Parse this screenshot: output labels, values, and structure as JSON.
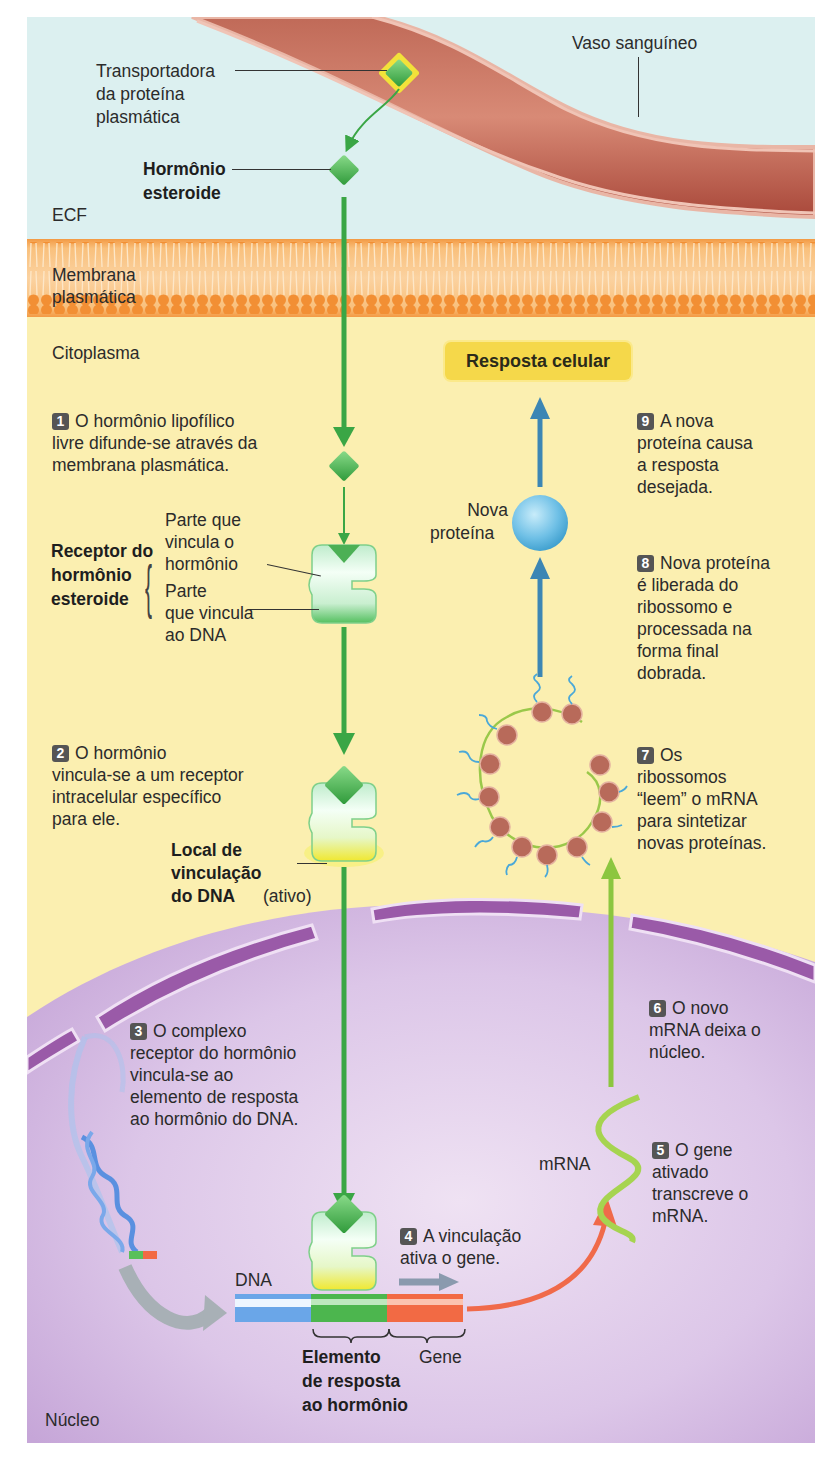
{
  "regions": {
    "ecf": "ECF",
    "membrane": "Membrana plasmática",
    "cytoplasm": "Citoplasma",
    "nucleus": "Núcleo"
  },
  "labels": {
    "blood_vessel": "Vaso sanguíneo",
    "carrier": [
      "Transportadora",
      "da proteína",
      "plasmática"
    ],
    "steroid_hormone": [
      "Hormônio",
      "esteroide"
    ],
    "receptor": [
      "Receptor do",
      "hormônio",
      "esteroide"
    ],
    "hormone_binding_part": [
      "Parte que",
      "vincula o",
      "hormônio"
    ],
    "dna_binding_part": [
      "Parte",
      "que vincula",
      "ao DNA"
    ],
    "dna_binding_site": [
      "Local de",
      "vinculação",
      "do DNA"
    ],
    "dna_binding_site_state": "(ativo)",
    "new_protein": [
      "Nova",
      "proteína"
    ],
    "mrna": "mRNA",
    "dna": "DNA",
    "hormone_response_element": [
      "Elemento",
      "de resposta",
      "ao hormônio"
    ],
    "gene": "Gene",
    "cell_response": "Resposta celular"
  },
  "steps": [
    {
      "n": "1",
      "lines": [
        "O hormônio lipofílico",
        "livre difunde-se através da",
        "membrana plasmática."
      ]
    },
    {
      "n": "2",
      "lines": [
        "O hormônio",
        "vincula-se a um receptor",
        "intracelular específico",
        "para ele."
      ]
    },
    {
      "n": "3",
      "lines": [
        "O complexo",
        "receptor do hormônio",
        "vincula-se ao",
        "elemento de resposta",
        "ao hormônio do DNA."
      ]
    },
    {
      "n": "4",
      "lines": [
        "A vinculação",
        "ativa o gene."
      ]
    },
    {
      "n": "5",
      "lines": [
        "O gene",
        "ativado",
        "transcreve o",
        "mRNA."
      ]
    },
    {
      "n": "6",
      "lines": [
        "O novo",
        "mRNA deixa o",
        "núcleo."
      ]
    },
    {
      "n": "7",
      "lines": [
        "Os",
        "ribossomos",
        "“leem” o mRNA",
        "para sintetizar",
        "novas proteínas."
      ]
    },
    {
      "n": "8",
      "lines": [
        "Nova proteína",
        "é liberada do",
        "ribossomo e",
        "processada na",
        "forma final",
        "dobrada."
      ]
    },
    {
      "n": "9",
      "lines": [
        "A nova",
        "proteína causa",
        "a resposta",
        "desejada."
      ]
    }
  ],
  "colors": {
    "ecf": "#dcf0f0",
    "membrane": "#f5a04a",
    "cytoplasm": "#fbefb0",
    "nucleus": "#d9c3e6",
    "vessel": "#b85a4a",
    "hormone": "#4fb84f",
    "arrow_green": "#3aa645",
    "arrow_blue": "#3c86b4",
    "arrow_red": "#f06a4a",
    "resposta_box": "#f5d84a"
  }
}
